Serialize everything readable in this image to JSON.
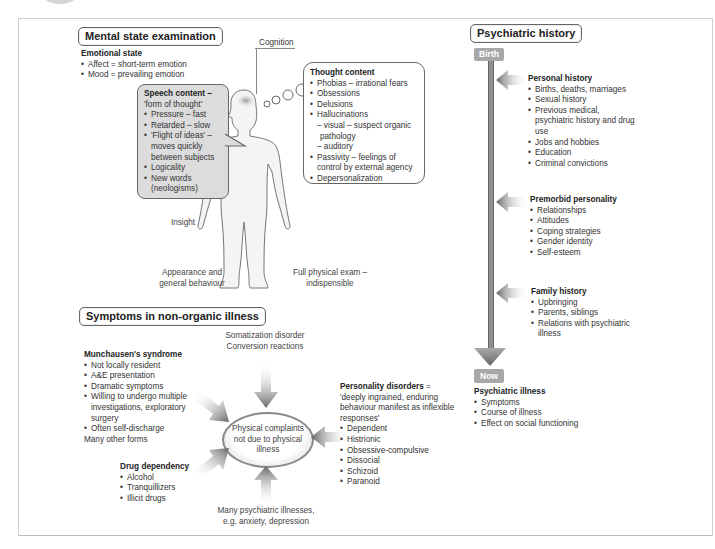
{
  "mental_state": {
    "title": "Mental state examination",
    "emotional_state": {
      "heading": "Emotional state",
      "items": [
        "Affect = short-term emotion",
        "Mood = prevailing emotion"
      ]
    },
    "cognition_label": "Cognition",
    "speech": {
      "heading": "Speech content –",
      "subheading": "'form of thought'",
      "items": [
        "Pressure – fast",
        "Retarded – slow",
        "'Flight of ideas' – moves quickly between subjects",
        "Logicality",
        "New words (neologisms)"
      ]
    },
    "thought": {
      "heading": "Thought content",
      "items": [
        "Phobias – irrational fears",
        "Obsessions",
        "Delusions",
        "Hallucinations"
      ],
      "hallucination_sub": [
        "– visual – suspect organic pathology",
        "– auditory"
      ],
      "items_after": [
        "Passivity – feelings of control by external agency",
        "Depersonalization"
      ]
    },
    "insight_label": "Insight",
    "appearance_label": "Appearance and general behaviour",
    "physical_exam_label": "Full physical exam – indispensible"
  },
  "history": {
    "title": "Psychiatric history",
    "birth_label": "Birth",
    "now_label": "Now",
    "personal": {
      "heading": "Personal history",
      "items": [
        "Births, deaths, marriages",
        "Sexual history",
        "Previous medical, psychiatric history and drug use",
        "Jobs and hobbies",
        "Education",
        "Criminal convictions"
      ]
    },
    "premorbid": {
      "heading": "Premorbid personality",
      "items": [
        "Relationships",
        "Attitudes",
        "Coping strategies",
        "Gender identity",
        "Self-esteem"
      ]
    },
    "family": {
      "heading": "Family history",
      "items": [
        "Upbringing",
        "Parents, siblings",
        "Relations with psychiatric illness"
      ]
    },
    "illness": {
      "heading": "Psychiatric illness",
      "items": [
        "Symptoms",
        "Course of illness",
        "Effect on social functioning"
      ]
    }
  },
  "non_organic": {
    "title": "Symptoms in non-organic illness",
    "center": "Physical complaints not due to physical illness",
    "somatization": "Somatization disorder\nConversion reactions",
    "munchausen": {
      "heading": "Munchausen's syndrome",
      "items": [
        "Not locally resident",
        "A&E presentation",
        "Dramatic symptoms",
        "Willing to undergo multiple investigations, exploratory surgery",
        "Often self-discharge"
      ],
      "footer": "Many other forms"
    },
    "drug": {
      "heading": "Drug dependency",
      "items": [
        "Alcohol",
        "Tranquillizers",
        "Illicit drugs"
      ]
    },
    "psychiatric": "Many psychiatric illnesses,\ne.g. anxiety, depression",
    "personality": {
      "heading": "Personality disorders",
      "heading_suffix": " =",
      "definition": "'deeply ingrained, enduring behaviour manifest as inflexible responses'",
      "items": [
        "Dependent",
        "Histrionic",
        "Obsessive-compulsive",
        "Dissocial",
        "Schizoid",
        "Paranoid"
      ]
    }
  }
}
